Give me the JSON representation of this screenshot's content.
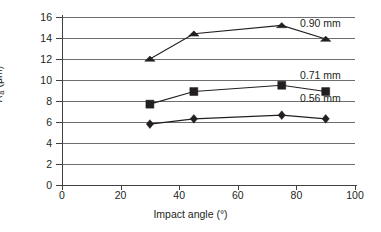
{
  "chart_data": {
    "type": "line",
    "title": "",
    "xlabel": "Impact angle (°)",
    "ylabel": "Rₐ (μm)",
    "ylabel_symbol": "R",
    "ylabel_subscript": "a",
    "ylabel_units": "(μm)",
    "xlim": [
      0,
      100
    ],
    "ylim": [
      0,
      16
    ],
    "xticks": [
      0,
      20,
      40,
      60,
      80,
      100
    ],
    "yticks": [
      0,
      2,
      4,
      6,
      8,
      10,
      12,
      14,
      16
    ],
    "grid": "horizontal",
    "legend_position": "inline-right",
    "x": [
      30,
      45,
      75,
      90
    ],
    "series": [
      {
        "name": "0.90 mm",
        "label": "0.90 mm",
        "marker": "triangle",
        "color": "#231f20",
        "values": [
          12.0,
          14.4,
          15.2,
          13.9
        ]
      },
      {
        "name": "0.71 mm",
        "label": "0.71 mm",
        "marker": "square",
        "color": "#231f20",
        "values": [
          7.7,
          8.9,
          9.5,
          8.9
        ]
      },
      {
        "name": "0.56 mm",
        "label": "0.56 mm",
        "marker": "diamond",
        "color": "#231f20",
        "values": [
          5.8,
          6.3,
          6.65,
          6.3
        ]
      }
    ]
  },
  "axes": {
    "y_tick_labels": [
      "0",
      "2",
      "4",
      "6",
      "8",
      "10",
      "12",
      "14",
      "16"
    ],
    "x_tick_labels": [
      "0",
      "20",
      "40",
      "60",
      "80",
      "100"
    ]
  },
  "colors": {
    "ink": "#231f20",
    "grid": "#6d6e71",
    "axis": "#404040",
    "background": "#ffffff"
  }
}
